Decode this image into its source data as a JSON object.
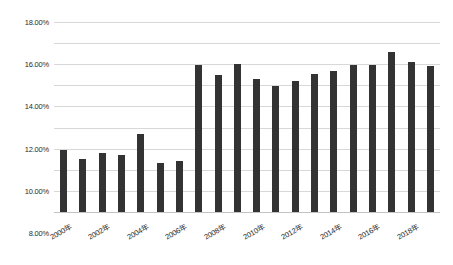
{
  "figure": {
    "title_partial": "",
    "caption_partial": "",
    "bar_color": "#333333",
    "grid_color": "#d8d8da",
    "axis_color": "#c3c3c5",
    "background": "#ffffff"
  },
  "chart_data": {
    "type": "bar",
    "title": "",
    "xlabel": "",
    "ylabel": "",
    "ylim": [
      0,
      18
    ],
    "yticks": [
      0,
      2,
      4,
      6,
      8,
      10,
      12,
      14,
      16,
      18
    ],
    "ytick_labels": [
      "0.00%",
      "2.00%",
      "4.00%",
      "6.00%",
      "8.00%",
      "10.00%",
      "12.00%",
      "14.00%",
      "16.00%",
      "18.00%"
    ],
    "grid": true,
    "grid_axis": "y",
    "legend": false,
    "categories": [
      "2000年",
      "2001年",
      "2002年",
      "2003年",
      "2004年",
      "2005年",
      "2006年",
      "2007年",
      "2008年",
      "2009年",
      "2010年",
      "2011年",
      "2012年",
      "2013年",
      "2014年",
      "2015年",
      "2016年",
      "2017年",
      "2018年",
      "2019年"
    ],
    "xtick_labels_shown": [
      "2000年",
      "2002年",
      "2004年",
      "2006年",
      "2008年",
      "2010年",
      "2012年",
      "2014年",
      "2016年",
      "2018年"
    ],
    "xtick_label_rotation_deg": -30,
    "values": [
      5.85,
      5.0,
      5.55,
      5.4,
      7.35,
      4.6,
      4.8,
      13.9,
      13.0,
      14.05,
      12.65,
      11.95,
      12.4,
      13.05,
      13.35,
      13.9,
      13.9,
      15.15,
      14.25,
      13.85
    ],
    "value_labels": [
      "5.85%",
      "5.00%",
      "5.55%",
      "5.40%",
      "7.35%",
      "4.60%",
      "4.80%",
      "13.90%",
      "13.00%",
      "14.05%",
      "12.65%",
      "11.95%",
      "12.40%",
      "13.05%",
      "13.35%",
      "13.90%",
      "13.90%",
      "15.15%",
      "14.25%",
      "13.85%"
    ],
    "series": [
      {
        "name": "",
        "values": [
          5.85,
          5.0,
          5.55,
          5.4,
          7.35,
          4.6,
          4.8,
          13.9,
          13.0,
          14.05,
          12.65,
          11.95,
          12.4,
          13.05,
          13.35,
          13.9,
          13.9,
          15.15,
          14.25,
          13.85
        ]
      }
    ]
  }
}
